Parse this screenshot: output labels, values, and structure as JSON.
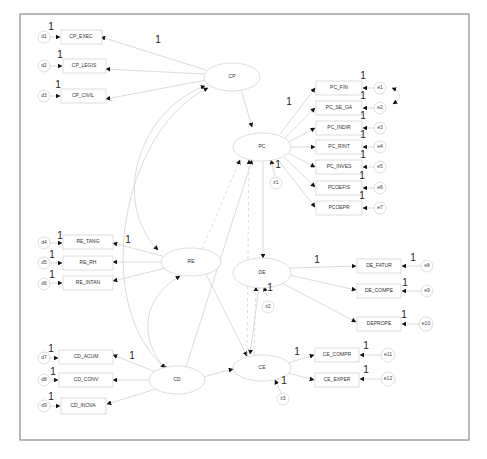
{
  "title": "",
  "colors": {
    "frame": "#8a8a8a",
    "node_stroke": "#d4d4d4",
    "arrow": "#d2d2d2",
    "arrowhead": "#111111",
    "text": "#333333"
  },
  "latent": {
    "CP": {
      "label": "CP",
      "cx": 232,
      "cy": 76
    },
    "PC": {
      "label": "PC",
      "cx": 262,
      "cy": 146
    },
    "RE": {
      "label": "RE",
      "cx": 191,
      "cy": 262
    },
    "DE": {
      "label": "DE",
      "cx": 262,
      "cy": 272
    },
    "CD": {
      "label": "CD",
      "cx": 177,
      "cy": 380
    },
    "CE": {
      "label": "CE",
      "cx": 262,
      "cy": 368
    }
  },
  "observed": {
    "CP_EXEC": "CP_EXEC",
    "CP_LEGIS": "CP_LEGIS",
    "CP_CIVIL": "CP_CIVIL",
    "PC_FIN": "PC_FIN",
    "PC_SE_GA": "PC_SE_GA",
    "PC_INDIR": "PC_INDIR",
    "PC_RINT": "PC_RINT",
    "PC_INVES": "PC_INVES",
    "PCOEFIS": "PCOEFIS",
    "PCOEPR": "PCOEPR",
    "RE_TANG": "RE_TANG",
    "RE_RH": "RE_RH",
    "RE_INTAN": "RE_INTAN",
    "DE_FATUR": "DE_FATUR",
    "DE_COMPE": "DE_COMPE",
    "DEPROPE": "DEPROPE",
    "CD_ACUM": "CD_ACUM",
    "CD_CONV": "CD_CONV",
    "CD_INOVA": "CD_INOVA",
    "CE_COMPR": "CE_COMPR",
    "CE_EXPER": "CE_EXPER"
  },
  "errors": {
    "d1": "d1",
    "d2": "d2",
    "d3": "d3",
    "d4": "d4",
    "d5": "d5",
    "d6": "d6",
    "d7": "d7",
    "d8": "d8",
    "d9": "d9",
    "e1": "e1",
    "e2": "e2",
    "e3": "e3",
    "e4": "e4",
    "e5": "e5",
    "e6": "e6",
    "e7": "e7",
    "e8": "e8",
    "e9": "e9",
    "e10": "e10",
    "e11": "e11",
    "e12": "e12",
    "z1": "z1",
    "z2": "z2",
    "z3": "z3"
  },
  "fixed_weight": "1"
}
